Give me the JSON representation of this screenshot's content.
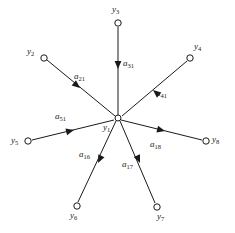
{
  "figure": {
    "type": "star-graph-diagram",
    "background_color": "#ffffff",
    "stroke_color": "#1a1a1a",
    "width": 235,
    "height": 233
  },
  "nodes": [
    {
      "id": "y1",
      "label_base": "y",
      "label_sub": "1",
      "label_text": "y1",
      "cx": 118,
      "cy": 118,
      "r": 3.0,
      "label_x": 103,
      "label_y": 123,
      "role": "center"
    },
    {
      "id": "y2",
      "label_base": "y",
      "label_sub": "2",
      "label_text": "y2",
      "cx": 44,
      "cy": 58,
      "r": 3.2,
      "label_x": 27,
      "label_y": 47,
      "role": "source"
    },
    {
      "id": "y3",
      "label_base": "y",
      "label_sub": "3",
      "label_text": "y3",
      "cx": 118,
      "cy": 23,
      "r": 3.2,
      "label_x": 112,
      "label_y": 5,
      "role": "source"
    },
    {
      "id": "y4",
      "label_base": "y",
      "label_sub": "4",
      "label_text": "y4",
      "cx": 190,
      "cy": 58,
      "r": 3.2,
      "label_x": 194,
      "label_y": 42,
      "role": "source"
    },
    {
      "id": "y5",
      "label_base": "y",
      "label_sub": "5",
      "label_text": "y5",
      "cx": 28,
      "cy": 141,
      "r": 3.2,
      "label_x": 11,
      "label_y": 136,
      "role": "source"
    },
    {
      "id": "y6",
      "label_base": "y",
      "label_sub": "6",
      "label_text": "y6",
      "cx": 77,
      "cy": 206,
      "r": 3.2,
      "label_x": 70,
      "label_y": 211,
      "role": "target"
    },
    {
      "id": "y7",
      "label_base": "y",
      "label_sub": "7",
      "label_text": "y7",
      "cx": 157,
      "cy": 207,
      "r": 3.2,
      "label_x": 157,
      "label_y": 212,
      "role": "target"
    },
    {
      "id": "y8",
      "label_base": "y",
      "label_sub": "8",
      "label_text": "y8",
      "cx": 206,
      "cy": 141,
      "r": 3.2,
      "label_x": 212,
      "label_y": 135,
      "role": "target"
    }
  ],
  "edges": [
    {
      "id": "a21",
      "from": "y2",
      "to": "y1",
      "label_base": "a",
      "label_sub": "21",
      "label_text": "a21",
      "x1": 47,
      "y1": 60,
      "x2": 115,
      "y2": 116,
      "arrow_x": 80,
      "arrow_y": 88,
      "arrow_angle": 39.5,
      "label_x": 74,
      "label_y": 72
    },
    {
      "id": "a31",
      "from": "y3",
      "to": "y1",
      "label_base": "a",
      "label_sub": "31",
      "label_text": "a31",
      "x1": 118,
      "y1": 27,
      "x2": 118,
      "y2": 115,
      "arrow_x": 118,
      "arrow_y": 69,
      "arrow_angle": 90,
      "label_x": 123,
      "label_y": 59
    },
    {
      "id": "a41",
      "from": "y4",
      "to": "y1",
      "label_base": "a",
      "label_sub": "41",
      "label_text": "a41",
      "x1": 187,
      "y1": 61,
      "x2": 122,
      "y2": 116,
      "arrow_x": 153,
      "arrow_y": 90,
      "arrow_angle": 220,
      "label_x": 156,
      "label_y": 89
    },
    {
      "id": "a51",
      "from": "y5",
      "to": "y1",
      "label_base": "a",
      "label_sub": "51",
      "label_text": "a51",
      "x1": 32,
      "y1": 140,
      "x2": 114,
      "y2": 120,
      "arrow_x": 74,
      "arrow_y": 130,
      "arrow_angle": -13.7,
      "label_x": 55,
      "label_y": 112
    },
    {
      "id": "a16",
      "from": "y1",
      "to": "y6",
      "label_base": "a",
      "label_sub": "16",
      "label_text": "a16",
      "x1": 116,
      "y1": 121,
      "x2": 78,
      "y2": 202,
      "arrow_x": 98,
      "arrow_y": 163,
      "arrow_angle": 115.1,
      "label_x": 79,
      "label_y": 150
    },
    {
      "id": "a17",
      "from": "y1",
      "to": "y7",
      "label_base": "a",
      "label_sub": "17",
      "label_text": "a17",
      "x1": 120,
      "y1": 121,
      "x2": 155,
      "y2": 203,
      "arrow_x": 140,
      "arrow_y": 163,
      "arrow_angle": 66.9,
      "label_x": 122,
      "label_y": 160
    },
    {
      "id": "a18",
      "from": "y1",
      "to": "y8",
      "label_base": "a",
      "label_sub": "18",
      "label_text": "a18",
      "x1": 121,
      "y1": 120,
      "x2": 202,
      "y2": 140,
      "arrow_x": 165,
      "arrow_y": 131,
      "arrow_angle": 13.9,
      "label_x": 150,
      "label_y": 140
    }
  ]
}
